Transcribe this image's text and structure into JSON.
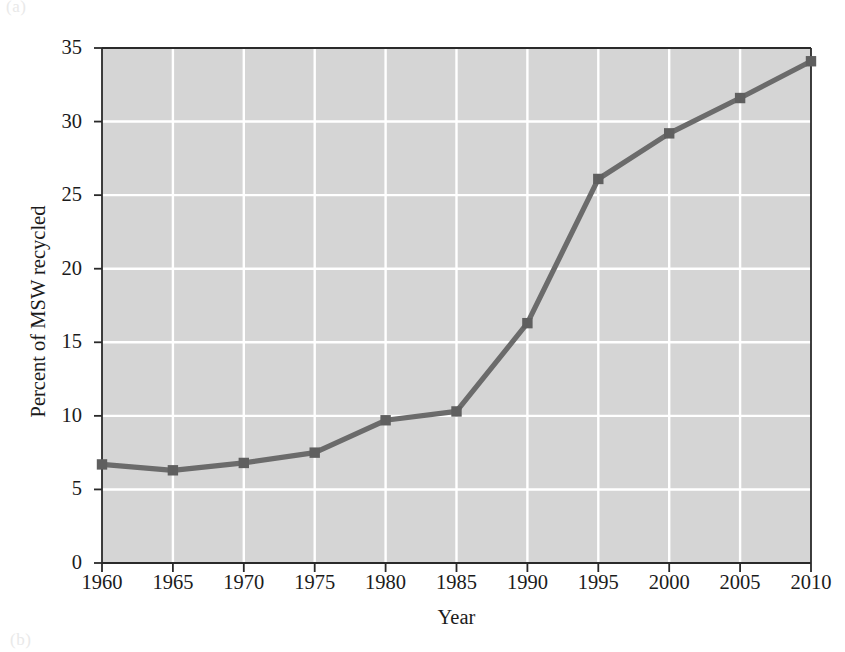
{
  "figure": {
    "panel_letter_top": "(a)",
    "panel_letter_bottom": "(b)"
  },
  "chart_data": {
    "type": "line",
    "title": "",
    "xlabel": "Year",
    "ylabel": "Percent of MSW recycled",
    "x": [
      1960,
      1965,
      1970,
      1975,
      1980,
      1985,
      1990,
      1995,
      2000,
      2005,
      2010
    ],
    "values": [
      6.7,
      6.3,
      6.8,
      7.5,
      9.7,
      10.3,
      16.3,
      26.1,
      29.2,
      31.6,
      34.1
    ],
    "categories": [
      "1960",
      "1965",
      "1970",
      "1975",
      "1980",
      "1985",
      "1990",
      "1995",
      "2000",
      "2005",
      "2010"
    ],
    "xtick_labels": [
      "1960",
      "1965",
      "1970",
      "1975",
      "1980",
      "1985",
      "1990",
      "1995",
      "2000",
      "2005",
      "2010"
    ],
    "ytick_labels": [
      "0",
      "5",
      "10",
      "15",
      "20",
      "25",
      "30",
      "35"
    ],
    "yticks": [
      0,
      5,
      10,
      15,
      20,
      25,
      30,
      35
    ],
    "xlim": [
      1960,
      2010
    ],
    "ylim": [
      0,
      35
    ],
    "grid": true,
    "grid_color": "#ffffff",
    "plot_background": "#d5d5d5",
    "line_color": "#6b6b6b",
    "marker_color": "#5f5f5f",
    "marker": "square",
    "legend": null,
    "legend_position": "none"
  }
}
